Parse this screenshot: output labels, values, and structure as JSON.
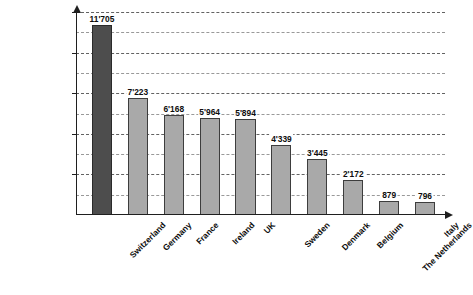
{
  "chart_data": {
    "type": "bar",
    "title": "",
    "xlabel": "",
    "ylabel": "(in CHF millions)",
    "categories": [
      "Switzerland",
      "Germany",
      "France",
      "Ireland",
      "UK",
      "Sweden",
      "Denmark",
      "Belgium",
      "The Netherlands",
      "Italy"
    ],
    "values": [
      11705,
      7223,
      6168,
      5964,
      5894,
      4339,
      3445,
      2172,
      879,
      796
    ],
    "value_labels": [
      "11'705",
      "7'223",
      "6'168",
      "5'964",
      "5'894",
      "4'339",
      "3'445",
      "2'172",
      "879",
      "796"
    ],
    "highlight_index": 0,
    "ylim": [
      0,
      12500
    ],
    "y_major_ticks": [
      2500,
      5000,
      7500,
      10000,
      12500
    ],
    "y_major_tick_labels": [
      "2'500",
      "5'000",
      "7'500",
      "10'000",
      "12'500"
    ],
    "y_minor_ticks": [
      1250,
      3750,
      6250,
      8750,
      11250
    ],
    "grid": true,
    "legend": "none",
    "colors": {
      "bar_fill": "#a9a9a9",
      "bar_stroke": "#3d3d3d",
      "highlight_fill": "#4d4d4d",
      "highlight_stroke": "#2a2a2a",
      "axis": "#1f1f1f",
      "grid": "#555555",
      "text": "#0d0d0d",
      "background": "#ffffff"
    }
  }
}
